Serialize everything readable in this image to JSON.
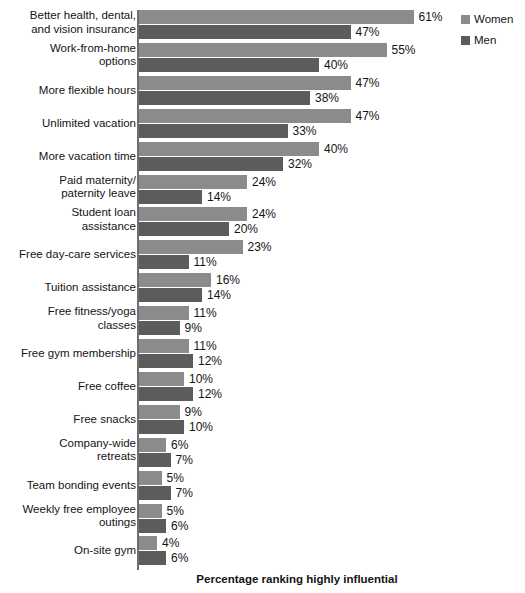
{
  "chart_data": {
    "type": "bar",
    "orientation": "horizontal",
    "title": "",
    "xlabel": "Percentage ranking highly influential",
    "ylabel": "",
    "xlim": [
      0,
      61
    ],
    "grid": false,
    "legend_position": "top-right",
    "value_suffix": "%",
    "categories": [
      "Better health, dental,\nand vision insurance",
      "Work-from-home\noptions",
      "More flexible hours",
      "Unlimited vacation",
      "More vacation time",
      "Paid maternity/\npaternity leave",
      "Student loan\nassistance",
      "Free day-care services",
      "Tuition assistance",
      "Free fitness/yoga\nclasses",
      "Free gym membership",
      "Free coffee",
      "Free snacks",
      "Company-wide\nretreats",
      "Team bonding events",
      "Weekly free employee\noutings",
      "On-site gym"
    ],
    "series": [
      {
        "name": "Women",
        "color": "#8b8b8b",
        "values": [
          61,
          55,
          47,
          47,
          40,
          24,
          24,
          23,
          16,
          11,
          11,
          10,
          9,
          6,
          5,
          5,
          4
        ],
        "labels": [
          "61%",
          "55%",
          "47%",
          "47%",
          "40%",
          "24%",
          "24%",
          "23%",
          "16%",
          "11%",
          "11%",
          "10%",
          "9%",
          "6%",
          "5%",
          "5%",
          "4%"
        ]
      },
      {
        "name": "Men",
        "color": "#5c5c5c",
        "values": [
          47,
          40,
          38,
          33,
          32,
          14,
          20,
          11,
          14,
          9,
          12,
          12,
          10,
          7,
          7,
          6,
          6
        ],
        "labels": [
          "47%",
          "40%",
          "38%",
          "33%",
          "32%",
          "14%",
          "20%",
          "11%",
          "14%",
          "9%",
          "12%",
          "12%",
          "10%",
          "7%",
          "7%",
          "6%",
          "6%"
        ]
      }
    ]
  },
  "legend": {
    "items": [
      {
        "label": "Women",
        "color": "#8b8b8b"
      },
      {
        "label": "Men",
        "color": "#5c5c5c"
      }
    ]
  },
  "footer": {
    "axis_title": "Percentage ranking highly influential"
  },
  "colors": {
    "women": "#8b8b8b",
    "men": "#5c5c5c",
    "axis": "#6e6e6e",
    "text": "#141414",
    "background": "#ffffff"
  }
}
